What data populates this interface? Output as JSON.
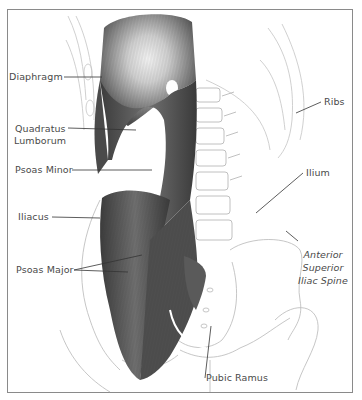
{
  "figure": {
    "labels": {
      "diaphragm": "Diaphragm",
      "quadratus_1": "Quadratus",
      "quadratus_2": "Lumborum",
      "psoas_minor": "Psoas Minor",
      "iliacus": "Iliacus",
      "psoas_major": "Psoas Major",
      "ribs": "Ribs",
      "ilium": "Ilium",
      "asis_1": "Anterior",
      "asis_2": "Superior",
      "asis_3": "Iliac Spine",
      "pubic_ramus": "Pubic Ramus"
    },
    "colors": {
      "muscle_dark": "#3a3a3a",
      "muscle_mid": "#6e6e6e",
      "muscle_light": "#d8d8d8",
      "bone_outline": "#b8b8b8",
      "leader_line": "#333333",
      "frame": "#8a8a8a"
    }
  }
}
